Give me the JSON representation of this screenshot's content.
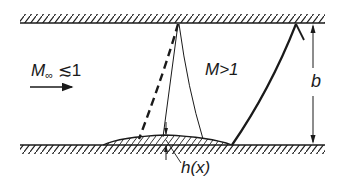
{
  "diagram": {
    "type": "channel-flow-with-bump",
    "labels": {
      "freestream_mach": "M",
      "freestream_mach_sub": "∞",
      "freestream_mach_rel": " ≲1",
      "supersonic_region": "M>1",
      "channel_height": "b",
      "bump_height": "h(x)"
    },
    "elements": [
      "upper wall (hatched)",
      "lower wall (hatched) with bump h(x)",
      "flow direction arrow",
      "dashed sonic line",
      "thin expansion/characteristic lines",
      "thick shock line with reflection at upper wall",
      "dimension arrow for b"
    ],
    "colors": {
      "ink": "#1a1a1a",
      "background": "#ffffff"
    }
  }
}
